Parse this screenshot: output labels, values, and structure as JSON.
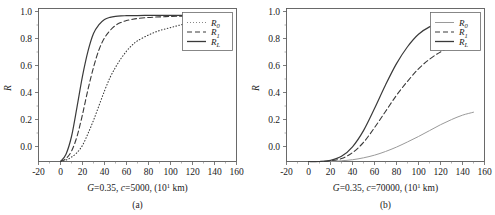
{
  "figure": {
    "panels": [
      {
        "id": "a",
        "caption": "(a)",
        "xlabel_parts": {
          "g": "G",
          "g_val": "=0.35, ",
          "c": "c",
          "c_val": "=5000, (10",
          "exp": "1",
          "unit": " km)"
        },
        "xlabel_full": "G=0.35, c=5000, (10^1 km)",
        "ylabel": "R",
        "xticks": [
          "-20",
          "0",
          "20",
          "40",
          "60",
          "80",
          "100",
          "120",
          "140",
          "160"
        ],
        "yticks": [
          "0.0",
          "0.2",
          "0.4",
          "0.6",
          "0.8",
          "1.0"
        ],
        "legend": [
          {
            "label": "R",
            "sub": "0",
            "style": "dotted"
          },
          {
            "label": "R",
            "sub": "1",
            "style": "dashed"
          },
          {
            "label": "R",
            "sub": "L",
            "style": "solid"
          }
        ]
      },
      {
        "id": "b",
        "caption": "(b)",
        "xlabel_parts": {
          "g": "G",
          "g_val": "=0.35, ",
          "c": "c",
          "c_val": "=70000, (10",
          "exp": "1",
          "unit": " km)"
        },
        "xlabel_full": "G=0.35, c=70000, (10^1 km)",
        "ylabel": "R",
        "xticks": [
          "-20",
          "0",
          "20",
          "40",
          "60",
          "80",
          "100",
          "120",
          "140",
          "160"
        ],
        "yticks": [
          "0.0",
          "0.2",
          "0.4",
          "0.6",
          "0.8",
          "1.0"
        ],
        "legend": [
          {
            "label": "R",
            "sub": "0",
            "style": "thin-solid"
          },
          {
            "label": "R",
            "sub": "1",
            "style": "dashed"
          },
          {
            "label": "R",
            "sub": "L",
            "style": "solid"
          }
        ]
      }
    ]
  },
  "colors": {
    "curve": "#3a3a3a",
    "curve_light": "#9a9a9a",
    "axis": "#4a4a4a",
    "text": "#1a1a1a"
  },
  "chart_data": [
    {
      "type": "line",
      "panel": "a",
      "title": "",
      "xlabel": "G=0.35, c=5000, (10^1 km)",
      "ylabel": "R",
      "xlim": [
        -20,
        160
      ],
      "ylim": [
        0.0,
        1.04
      ],
      "xticks": [
        -20,
        0,
        20,
        40,
        60,
        80,
        100,
        120,
        140,
        160
      ],
      "yticks": [
        0.0,
        0.2,
        0.4,
        0.6,
        0.8,
        1.0
      ],
      "grid": false,
      "legend_position": "upper-right",
      "x": [
        0,
        5,
        10,
        15,
        20,
        25,
        30,
        35,
        40,
        45,
        50,
        55,
        60,
        65,
        70,
        80,
        90,
        100,
        110,
        120,
        130,
        135
      ],
      "series": [
        {
          "name": "R_0",
          "style": "dotted",
          "values": [
            0.0,
            0.01,
            0.03,
            0.06,
            0.11,
            0.19,
            0.28,
            0.38,
            0.48,
            0.57,
            0.64,
            0.7,
            0.75,
            0.79,
            0.82,
            0.86,
            0.89,
            0.91,
            0.93,
            0.945,
            0.955,
            0.96
          ]
        },
        {
          "name": "R_1",
          "style": "dashed",
          "values": [
            0.0,
            0.02,
            0.07,
            0.17,
            0.32,
            0.49,
            0.64,
            0.76,
            0.84,
            0.89,
            0.925,
            0.945,
            0.958,
            0.966,
            0.972,
            0.979,
            0.983,
            0.986,
            0.988,
            0.989,
            0.99,
            0.99
          ]
        },
        {
          "name": "R_L",
          "style": "solid",
          "values": [
            0.0,
            0.05,
            0.17,
            0.37,
            0.58,
            0.75,
            0.87,
            0.93,
            0.965,
            0.98,
            0.987,
            0.99,
            0.991,
            0.992,
            0.992,
            0.993,
            0.993,
            0.993,
            0.993,
            0.993,
            0.993,
            0.993
          ]
        }
      ]
    },
    {
      "type": "line",
      "panel": "b",
      "title": "",
      "xlabel": "G=0.35, c=70000, (10^1 km)",
      "ylabel": "R",
      "xlim": [
        -20,
        160
      ],
      "ylim": [
        0.0,
        1.04
      ],
      "xticks": [
        -20,
        0,
        20,
        40,
        60,
        80,
        100,
        120,
        140,
        160
      ],
      "yticks": [
        0.0,
        0.2,
        0.4,
        0.6,
        0.8,
        1.0
      ],
      "grid": false,
      "legend_position": "upper-right",
      "x": [
        0,
        10,
        20,
        30,
        40,
        50,
        60,
        70,
        80,
        90,
        100,
        110,
        120,
        130,
        140,
        150
      ],
      "series": [
        {
          "name": "R_0",
          "style": "thin-solid",
          "values": [
            0.0,
            0.0,
            0.0,
            0.005,
            0.012,
            0.025,
            0.043,
            0.068,
            0.098,
            0.133,
            0.17,
            0.21,
            0.25,
            0.285,
            0.315,
            0.335
          ]
        },
        {
          "name": "R_1",
          "style": "dashed",
          "values": [
            0.0,
            0.0,
            0.005,
            0.02,
            0.06,
            0.13,
            0.23,
            0.34,
            0.45,
            0.545,
            0.63,
            0.695,
            0.745,
            0.78,
            0.8,
            0.812
          ]
        },
        {
          "name": "R_L",
          "style": "solid",
          "values": [
            0.0,
            0.0,
            0.008,
            0.035,
            0.1,
            0.21,
            0.36,
            0.52,
            0.665,
            0.78,
            0.865,
            0.915,
            0.943,
            0.953,
            0.95,
            0.942
          ]
        }
      ]
    }
  ]
}
